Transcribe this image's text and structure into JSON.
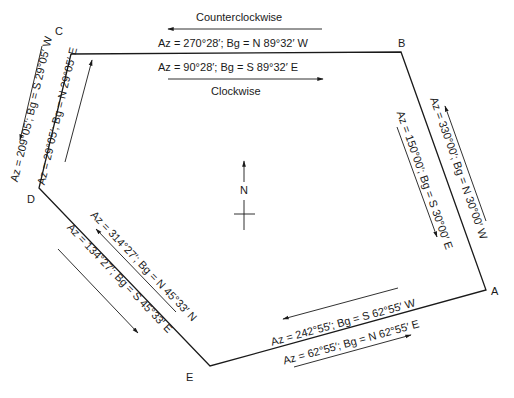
{
  "diagram": {
    "type": "traverse-polygon",
    "vertices": [
      {
        "id": "A",
        "label": "A"
      },
      {
        "id": "B",
        "label": "B"
      },
      {
        "id": "C",
        "label": "C"
      },
      {
        "id": "D",
        "label": "D"
      },
      {
        "id": "E",
        "label": "E"
      }
    ],
    "direction_labels": {
      "counterclockwise": "Counterclockwise",
      "clockwise": "Clockwise"
    },
    "north_arrow": {
      "label": "N"
    },
    "courses": {
      "CB_ccw": "Az = 270°28′; Bg = N 89°32′ W",
      "CB_cw": "Az = 90°28′; Bg = S 89°32′ E",
      "BA_ccw": "Az = 330°00′; Bg = N 30°00′ W",
      "BA_cw": "Az = 150°00′; Bg = S 30°00′ E",
      "AE_ccw": "Az = 242°55′; Bg = S 62°55′ W",
      "AE_cw": "Az = 62°55′; Bg = N 62°55′ E",
      "ED_ccw": "Az = 314°27′; Bg = N 45°33′ N",
      "ED_cw": "Az = 134°27′; Bg = S 45°33′ E",
      "DC_ccw": "Az = 209°05′; Bg = S 29°05′ W",
      "DC_cw": "Az = 29°05′; Bg = N 29°05′ E"
    },
    "colors": {
      "line": "#1a1a1a",
      "background": "#ffffff"
    }
  }
}
